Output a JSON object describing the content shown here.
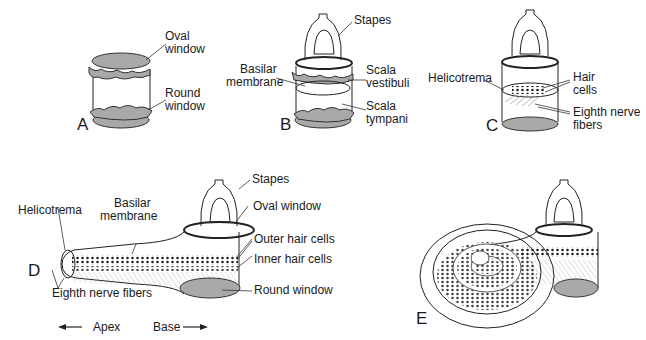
{
  "figure": {
    "panels": {
      "A": {
        "letter": "A",
        "labels": {
          "oval_window": [
            "Oval",
            "window"
          ],
          "round_window": [
            "Round",
            "window"
          ]
        }
      },
      "B": {
        "letter": "B",
        "labels": {
          "stapes": "Stapes",
          "basilar_membrane": [
            "Basilar",
            "membrane"
          ],
          "scala_vestibuli": [
            "Scala",
            "vestibuli"
          ],
          "scala_tympani": [
            "Scala",
            "tympani"
          ]
        }
      },
      "C": {
        "letter": "C",
        "labels": {
          "helicotrema": "Helicotrema",
          "hair_cells": [
            "Hair",
            "cells"
          ],
          "eighth_nerve_fibers": [
            "Eighth nerve",
            "fibers"
          ]
        }
      },
      "D": {
        "letter": "D",
        "labels": {
          "stapes": "Stapes",
          "oval_window": "Oval window",
          "helicotrema": "Helicotrema",
          "basilar_membrane": [
            "Basilar",
            "membrane"
          ],
          "outer_hair_cells": "Outer hair cells",
          "inner_hair_cells": "Inner hair cells",
          "round_window": "Round window",
          "eighth_nerve_fibers": "Eighth nerve fibers"
        },
        "direction": {
          "apex": "Apex",
          "base": "Base"
        }
      },
      "E": {
        "letter": "E"
      }
    },
    "colors": {
      "ink": "#222222",
      "window_fill": "#a9a9a9",
      "background": "#ffffff"
    }
  }
}
